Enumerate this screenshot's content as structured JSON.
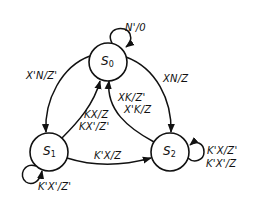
{
  "diagram": {
    "type": "state-diagram",
    "colors": {
      "stroke": "#111111",
      "background": "#ffffff",
      "text": "#111111"
    },
    "states": [
      {
        "id": "S0",
        "name": "S",
        "sub": "0"
      },
      {
        "id": "S1",
        "name": "S",
        "sub": "1"
      },
      {
        "id": "S2",
        "name": "S",
        "sub": "2"
      }
    ],
    "transitions": [
      {
        "from": "S0",
        "to": "S0",
        "label": "N'/0"
      },
      {
        "from": "S0",
        "to": "S1",
        "label": "X'N/Z'"
      },
      {
        "from": "S0",
        "to": "S2",
        "label": "XN/Z"
      },
      {
        "from": "S1",
        "to": "S0",
        "label_lines": [
          "KX/Z",
          "KX'/Z'"
        ]
      },
      {
        "from": "S2",
        "to": "S0",
        "label_lines": [
          "XK/Z'",
          "X'K/Z"
        ]
      },
      {
        "from": "S1",
        "to": "S2",
        "label": "K'X/Z"
      },
      {
        "from": "S1",
        "to": "S1",
        "label": "K'X'/Z'"
      },
      {
        "from": "S2",
        "to": "S2",
        "label_lines": [
          "K'X/Z'",
          "K'X'/Z"
        ]
      }
    ]
  }
}
